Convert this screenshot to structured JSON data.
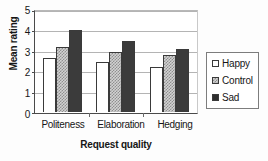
{
  "chart_data": {
    "type": "bar",
    "title": "",
    "xlabel": "Request quality",
    "ylabel": "Mean rating",
    "categories": [
      "Politeness",
      "Elaboration",
      "Hedging"
    ],
    "series": [
      {
        "name": "Happy",
        "values": [
          2.65,
          2.5,
          2.25
        ],
        "fill": "open-white"
      },
      {
        "name": "Control",
        "values": [
          3.2,
          2.95,
          2.8
        ],
        "fill": "gray-checkered"
      },
      {
        "name": "Sad",
        "values": [
          4.05,
          3.5,
          3.1
        ],
        "fill": "solid-black"
      }
    ],
    "ylim": [
      0,
      5
    ],
    "yticks": [
      5,
      4,
      3,
      2,
      1,
      0
    ],
    "ytick_labels": [
      "5",
      "4",
      "3",
      "2",
      "1",
      "0"
    ],
    "grid": true,
    "grid_axis": "y",
    "legend_position": "right"
  },
  "legend": {
    "items": [
      {
        "label": "Happy",
        "swatch": "open-square-icon"
      },
      {
        "label": "Control",
        "swatch": "checkered-square-icon"
      },
      {
        "label": "Sad",
        "swatch": "filled-square-icon"
      }
    ]
  },
  "colors": {
    "happy": "#ffffff",
    "control": "#d2d2d2",
    "sad": "#3b3b3b",
    "axis": "#4a4a4a",
    "grid": "#b4b4b4",
    "text": "#161616"
  }
}
